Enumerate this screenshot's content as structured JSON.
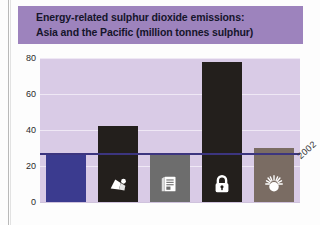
{
  "figure": {
    "title_line1": "Energy-related sulphur dioxide emissions:",
    "title_line2": "Asia and the Pacific (million tonnes sulphur)",
    "banner_color": "#9d83bd",
    "plot_background": "#d9cbe6",
    "reference_line_color": "#3c357f"
  },
  "chart_data": {
    "type": "bar",
    "title": "Energy-related sulphur dioxide emissions: Asia and the Pacific (million tonnes sulphur)",
    "xlabel": "",
    "ylabel": "million tonnes sulphur",
    "ylim": [
      0,
      80
    ],
    "yticks": [
      0,
      20,
      40,
      60,
      80
    ],
    "ytick_labels": [
      "0",
      "20",
      "40",
      "60",
      "80"
    ],
    "grid": true,
    "legend": "none",
    "categories": [
      "2002",
      "Coal-intensive",
      "Oil-intensive",
      "Business as usual",
      "Sustainable"
    ],
    "category_icons": [
      "none",
      "coal-icon",
      "oil-barrel-icon",
      "padlock-icon",
      "sun-icon"
    ],
    "values": [
      27,
      42,
      27,
      78,
      30
    ],
    "bar_colors": [
      "#3b3b8f",
      "#231f1c",
      "#6d6d6d",
      "#231f1c",
      "#7a6c63"
    ],
    "annotations": [
      {
        "text": "2002",
        "type": "reference-line",
        "value": 27,
        "rotation": -42
      }
    ]
  }
}
